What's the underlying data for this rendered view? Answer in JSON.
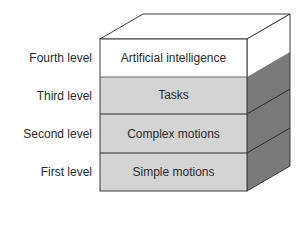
{
  "diagram": {
    "type": "stacked-block-3d",
    "levels": [
      {
        "level_label": "Fourth level",
        "content": "Artificial intelligence",
        "fill": "#ffffff"
      },
      {
        "level_label": "Third level",
        "content": "Tasks",
        "fill": "#d4d4d4"
      },
      {
        "level_label": "Second level",
        "content": "Complex motions",
        "fill": "#d4d4d4"
      },
      {
        "level_label": "First level",
        "content": "Simple motions",
        "fill": "#d4d4d4"
      }
    ],
    "colors": {
      "top_face": "#ffffff",
      "side_upper": "#ffffff",
      "side_lower": "#7a7a7a",
      "stroke": "#3a3a3a"
    }
  }
}
